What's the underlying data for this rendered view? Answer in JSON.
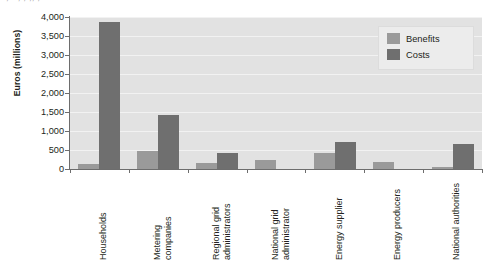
{
  "caption_remnant": "·  ,  ·            ,   ,   ,,                                          ,",
  "chart_data": {
    "type": "bar",
    "title": "",
    "xlabel": "",
    "ylabel": "Euros (millions)",
    "ylim": [
      0,
      4000
    ],
    "ytick_labels": [
      "4,000",
      "3,500",
      "3,000",
      "2,500",
      "2,000",
      "1,500",
      "1,000",
      "500",
      "0"
    ],
    "ytick_values": [
      4000,
      3500,
      3000,
      2500,
      2000,
      1500,
      1000,
      500,
      0
    ],
    "grid": true,
    "legend_position": "top-right",
    "categories": [
      "Households",
      "Metering companies",
      "Regional grid administrators",
      "National grid administrator",
      "Energy supplier",
      "Energy producers",
      "National authorities"
    ],
    "category_lines": [
      [
        "Households"
      ],
      [
        "Metering",
        "companies"
      ],
      [
        "Regional grid",
        "administrators"
      ],
      [
        "National grid",
        "administrator"
      ],
      [
        "Energy supplier"
      ],
      [
        "Energy producers"
      ],
      [
        "National authorities"
      ]
    ],
    "series": [
      {
        "name": "Benefits",
        "color": "#9a9a9a",
        "values": [
          120,
          480,
          150,
          230,
          430,
          180,
          60
        ]
      },
      {
        "name": "Costs",
        "color": "#6f6f6f",
        "values": [
          3870,
          1420,
          420,
          0,
          700,
          0,
          650
        ]
      }
    ]
  },
  "legend": {
    "items": [
      {
        "label": "Benefits",
        "color": "#9a9a9a"
      },
      {
        "label": "Costs",
        "color": "#6f6f6f"
      }
    ]
  }
}
